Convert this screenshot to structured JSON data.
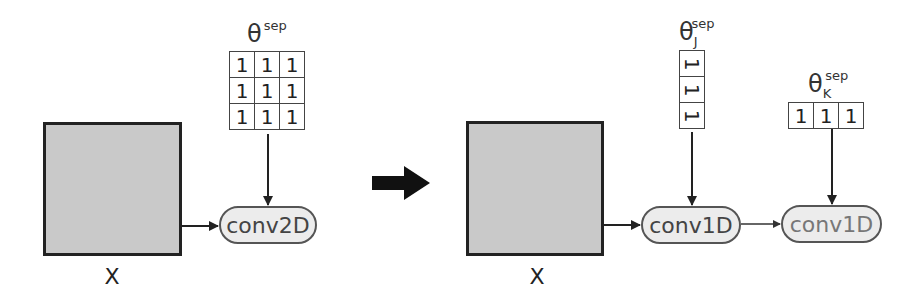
{
  "left": {
    "input_label": "X",
    "kernel_label": {
      "base": "θ",
      "superscript": "sep"
    },
    "kernel_values": [
      [
        "1",
        "1",
        "1"
      ],
      [
        "1",
        "1",
        "1"
      ],
      [
        "1",
        "1",
        "1"
      ]
    ],
    "op_label": "conv2D"
  },
  "transform_arrow": "right-arrow",
  "right": {
    "input_label": "X",
    "kernel_j_label": {
      "base": "θ",
      "subscript": "J",
      "superscript": "sep"
    },
    "kernel_j_values": [
      "1",
      "1",
      "1"
    ],
    "kernel_k_label": {
      "base": "θ",
      "subscript": "K",
      "superscript": "sep"
    },
    "kernel_k_values": [
      "1",
      "1",
      "1"
    ],
    "op1_label": "conv1D",
    "op2_label": "conv1D"
  },
  "colors": {
    "input_fill": "#c9c9c9",
    "pill_fill": "#ececec",
    "stroke": "#222222"
  }
}
